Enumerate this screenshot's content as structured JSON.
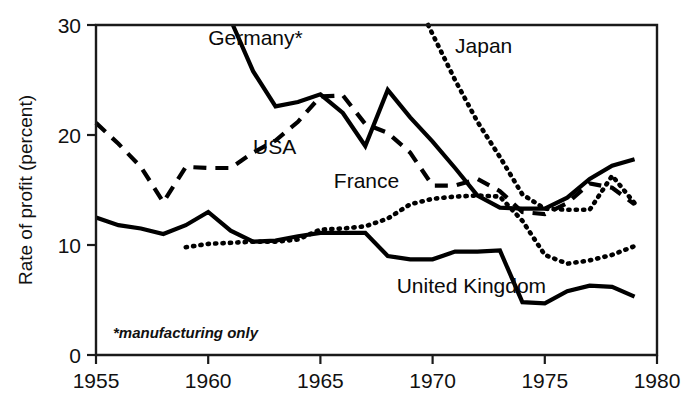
{
  "chart_data": {
    "type": "line",
    "title": "",
    "xlabel": "",
    "ylabel": "Rate of profit (percent)",
    "xlim": [
      1955,
      1980
    ],
    "ylim": [
      0,
      30
    ],
    "xticks": [
      1955,
      1960,
      1965,
      1970,
      1975,
      1980
    ],
    "xtick_labels": [
      "1955",
      "1960",
      "1965",
      "1970",
      "1975",
      "1980"
    ],
    "yticks": [
      0,
      10,
      20,
      30
    ],
    "ytick_labels": [
      "0",
      "10",
      "20",
      "30"
    ],
    "grid": false,
    "legend_position": "inline-annotations",
    "footnote": "*manufacturing only",
    "series": [
      {
        "name": "Germany*",
        "label": "Germany*",
        "style": "solid",
        "clipped_above_axis": true,
        "label_x": 1960.0,
        "label_y": 28.2,
        "x": [
          1961.1,
          1962,
          1963,
          1964,
          1965,
          1966,
          1967,
          1968,
          1969,
          1970,
          1971,
          1972,
          1973,
          1974,
          1975,
          1976,
          1977,
          1978,
          1979
        ],
        "y": [
          30.0,
          25.8,
          22.6,
          23.0,
          23.7,
          22.0,
          19.0,
          24.1,
          21.6,
          19.4,
          17.0,
          14.5,
          13.4,
          13.3,
          13.3,
          14.3,
          16.0,
          17.2,
          17.8
        ]
      },
      {
        "name": "USA",
        "label": "USA",
        "style": "dashed",
        "clipped_above_axis": false,
        "label_x": 1962.0,
        "label_y": 18.3,
        "x": [
          1955,
          1956,
          1957,
          1958,
          1959,
          1960,
          1961,
          1962,
          1963,
          1964,
          1965,
          1966,
          1967,
          1968,
          1969,
          1970,
          1971,
          1972,
          1973,
          1974,
          1975,
          1976,
          1977,
          1978,
          1979
        ],
        "y": [
          21.1,
          19.2,
          17.1,
          13.9,
          17.1,
          17.0,
          17.0,
          18.4,
          19.5,
          21.2,
          23.5,
          23.6,
          21.0,
          20.2,
          18.4,
          15.4,
          15.4,
          16.0,
          14.9,
          13.0,
          12.8,
          13.8,
          15.6,
          15.2,
          13.7
        ]
      },
      {
        "name": "Japan",
        "label": "Japan",
        "style": "dotted",
        "clipped_above_axis": true,
        "label_x": 1971.0,
        "label_y": 27.5,
        "x": [
          1969.8,
          1971,
          1972,
          1973,
          1974,
          1975,
          1976,
          1977,
          1978,
          1979
        ],
        "y": [
          30.0,
          25.0,
          21.2,
          18.0,
          14.6,
          13.3,
          13.2,
          13.2,
          16.3,
          13.8
        ]
      },
      {
        "name": "France",
        "label": "France",
        "style": "dotted",
        "clipped_above_axis": false,
        "label_x": 1965.6,
        "label_y": 15.2,
        "x": [
          1959,
          1960,
          1961,
          1962,
          1963,
          1964,
          1965,
          1966,
          1967,
          1968,
          1969,
          1970,
          1971,
          1972,
          1973,
          1974,
          1975,
          1976,
          1977,
          1978,
          1979
        ],
        "y": [
          9.8,
          10.1,
          10.2,
          10.3,
          10.3,
          10.5,
          11.4,
          11.5,
          11.7,
          12.4,
          13.7,
          14.2,
          14.4,
          14.5,
          14.4,
          12.2,
          9.1,
          8.3,
          8.6,
          9.1,
          9.9
        ]
      },
      {
        "name": "United Kingdom",
        "label": "United Kingdom",
        "style": "solid",
        "clipped_above_axis": false,
        "label_x": 1968.4,
        "label_y": 5.6,
        "x": [
          1955,
          1956,
          1957,
          1958,
          1959,
          1960,
          1961,
          1962,
          1963,
          1964,
          1965,
          1966,
          1967,
          1968,
          1969,
          1970,
          1971,
          1972,
          1973,
          1974,
          1975,
          1976,
          1977,
          1978,
          1979
        ],
        "y": [
          12.5,
          11.8,
          11.5,
          11.0,
          11.8,
          13.0,
          11.3,
          10.3,
          10.4,
          10.8,
          11.1,
          11.1,
          11.1,
          9.0,
          8.7,
          8.7,
          9.4,
          9.4,
          9.5,
          4.8,
          4.7,
          5.8,
          6.3,
          6.2,
          5.3
        ]
      }
    ]
  }
}
